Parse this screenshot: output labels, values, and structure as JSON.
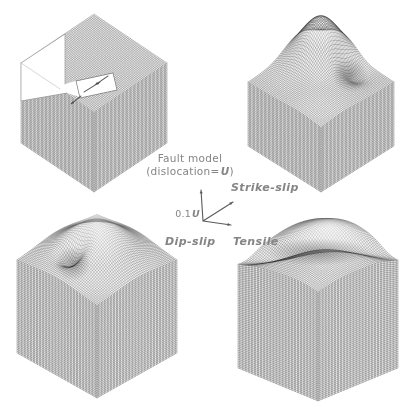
{
  "labels": {
    "fault_model_line1": "Fault model",
    "dislocation_prefix": "(dislocation=",
    "dislocation_symbol": "U",
    "dislocation_suffix": ")",
    "scale_value": "0.1",
    "scale_symbol": "U",
    "strike_slip": "Strike-slip",
    "dip_slip": "Dip-slip",
    "tensile": "Tensile"
  },
  "colors": {
    "background": "#ffffff",
    "mesh_line": "#2b2b2b",
    "top_fill": "#f1f1f1",
    "left_fill": "#ececec",
    "right_fill": "#eeeeee",
    "label_text": "#858585",
    "cut_fill": "#ffffff",
    "cut_edge": "#9a9a9a",
    "patch_edge": "#7d7d7d",
    "slip_arrow": "#4d4d4d",
    "axis_arrow": "#5a5a5a"
  },
  "figure": {
    "cubes": [
      {
        "id": "fault-model",
        "T": [
          94,
          14
        ],
        "W": 73,
        "Hr": 49,
        "Vh": 80,
        "features": []
      },
      {
        "id": "strike-slip",
        "T": [
          321,
          36
        ],
        "W": 73,
        "Hr": 46,
        "Vh": 64,
        "features": [
          {
            "type": "gauss",
            "a": 0.3,
            "b": 0.3,
            "amp": 46,
            "s": 0.21,
            "shade": "light",
            "sr": 2.0
          },
          {
            "type": "gauss",
            "a": 0.62,
            "b": 0.22,
            "amp": -14,
            "s": 0.11,
            "shade": "dark",
            "sr": 2.2
          },
          {
            "type": "gauss",
            "a": 0.7,
            "b": 0.7,
            "amp": 8,
            "s": 0.2
          }
        ]
      },
      {
        "id": "dip-slip",
        "T": [
          97,
          216
        ],
        "W": 80,
        "Hr": 45,
        "Vh": 92,
        "features": [
          {
            "type": "gauss",
            "a": 0.48,
            "b": 0.48,
            "amp": 36,
            "s": 0.27,
            "shade": "light",
            "sr": 2.0
          },
          {
            "type": "gauss",
            "a": 0.42,
            "b": 0.72,
            "amp": -20,
            "s": 0.09,
            "shade": "dark",
            "sr": 2.4
          }
        ]
      },
      {
        "id": "tensile",
        "T": [
          318,
          230
        ],
        "W": 80,
        "Hr": 33,
        "Vh": 105,
        "features": [
          {
            "type": "gauss",
            "a": 0.42,
            "b": 0.28,
            "amp": 28,
            "s": 0.38,
            "shade": "light",
            "sr": 1.6
          },
          {
            "type": "trench",
            "c": 0.95,
            "amp": -16,
            "ss": 0.12,
            "sd": 0.6,
            "shade": "dark"
          },
          {
            "type": "gauss",
            "a": 0.78,
            "b": 0.78,
            "amp": 7,
            "s": 0.22
          }
        ]
      }
    ],
    "cutaway": {
      "plane": [
        [
          21,
          63
        ],
        [
          65,
          34
        ],
        [
          65,
          84
        ],
        [
          79,
          80
        ],
        [
          83,
          98
        ],
        [
          67,
          93
        ],
        [
          21,
          101
        ]
      ],
      "patch": [
        [
          76,
          81
        ],
        [
          113,
          73
        ],
        [
          117,
          90
        ],
        [
          80,
          98
        ]
      ],
      "edges": [
        [
          21,
          63,
          65,
          34
        ],
        [
          65,
          34,
          65,
          84
        ],
        [
          21,
          101,
          67,
          93
        ],
        [
          21,
          63,
          21,
          101
        ],
        [
          21,
          63,
          60,
          89
        ]
      ],
      "slip_arrows": [
        [
          84,
          92,
          100,
          82
        ],
        [
          108,
          76,
          95,
          85
        ],
        [
          81,
          96,
          71,
          104
        ]
      ]
    },
    "axis": {
      "origin": [
        203,
        221
      ],
      "tips": [
        [
          201,
          190
        ],
        [
          233,
          202
        ],
        [
          231,
          225
        ]
      ]
    }
  }
}
